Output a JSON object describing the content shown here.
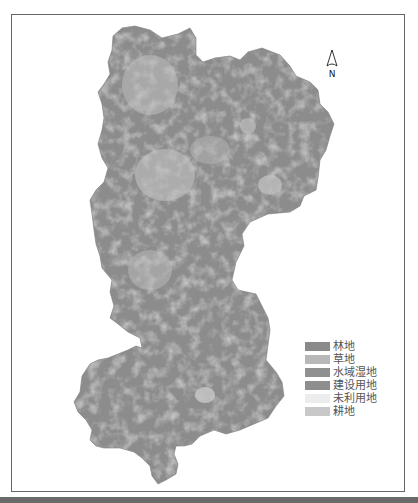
{
  "map": {
    "north_arrow": {
      "label": "N"
    },
    "legend": {
      "items": [
        {
          "label": "林地",
          "color": "#8a8a8a"
        },
        {
          "label": "草地",
          "color": "#b8b8b8"
        },
        {
          "label": "水域湿地",
          "color": "#909090"
        },
        {
          "label": "建设用地",
          "color": "#8e8e8e"
        },
        {
          "label": "未利用地",
          "color": "#ececec"
        },
        {
          "label": "耕地",
          "color": "#c8c8c8"
        }
      ]
    },
    "region_fill_color": "#8c8c8c",
    "frame_color": "#666666"
  }
}
